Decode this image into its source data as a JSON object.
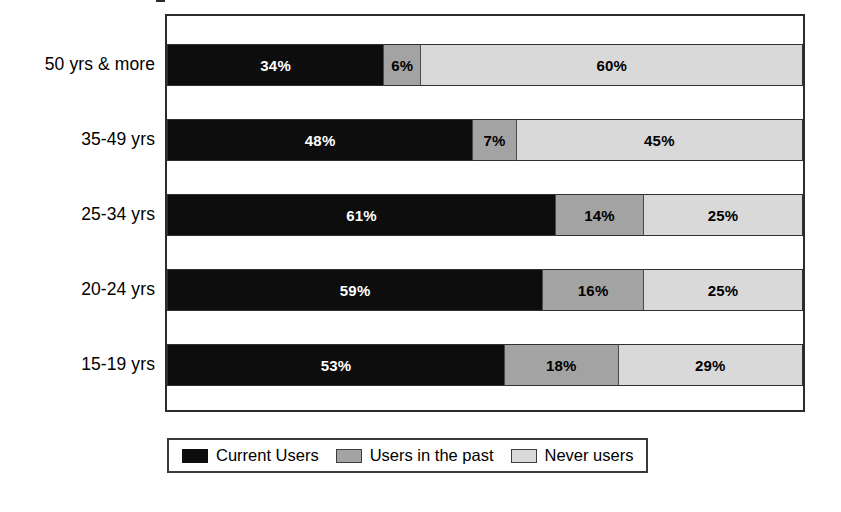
{
  "chart_data": {
    "type": "bar",
    "orientation": "horizontal",
    "stacked": true,
    "normalized_percent": true,
    "title": "",
    "subtitle": "",
    "xlabel": "",
    "ylabel": "",
    "xlim": [
      0,
      100
    ],
    "grid": false,
    "legend_position": "bottom",
    "categories": [
      "50 yrs & more",
      "35-49 yrs",
      "25-34 yrs",
      "20-24 yrs",
      "15-19 yrs"
    ],
    "series": [
      {
        "name": "Current Users",
        "color": "#0d0d0d",
        "values": [
          34,
          48,
          61,
          59,
          53
        ],
        "labels": [
          "34%",
          "48%",
          "61%",
          "59%",
          "53%"
        ]
      },
      {
        "name": "Users in the past",
        "color": "#a3a3a3",
        "values": [
          6,
          7,
          14,
          16,
          18
        ],
        "labels": [
          "6%",
          "7%",
          "14%",
          "16%",
          "18%"
        ]
      },
      {
        "name": "Never users",
        "color": "#d9d9d9",
        "values": [
          60,
          45,
          25,
          25,
          29
        ],
        "labels": [
          "60%",
          "45%",
          "25%",
          "25%",
          "29%"
        ]
      }
    ],
    "rows": [
      {
        "category": "50 yrs & more",
        "segments": [
          {
            "series": "Current Users",
            "value": 34,
            "label": "34%",
            "color": "#0d0d0d",
            "class": "seg-current"
          },
          {
            "series": "Users in the past",
            "value": 6,
            "label": "6%",
            "color": "#a3a3a3",
            "class": "seg-past"
          },
          {
            "series": "Never users",
            "value": 60,
            "label": "60%",
            "color": "#d9d9d9",
            "class": "seg-never"
          }
        ]
      },
      {
        "category": "35-49 yrs",
        "segments": [
          {
            "series": "Current Users",
            "value": 48,
            "label": "48%",
            "color": "#0d0d0d",
            "class": "seg-current"
          },
          {
            "series": "Users in the past",
            "value": 7,
            "label": "7%",
            "color": "#a3a3a3",
            "class": "seg-past"
          },
          {
            "series": "Never users",
            "value": 45,
            "label": "45%",
            "color": "#d9d9d9",
            "class": "seg-never"
          }
        ]
      },
      {
        "category": "25-34 yrs",
        "segments": [
          {
            "series": "Current Users",
            "value": 61,
            "label": "61%",
            "color": "#0d0d0d",
            "class": "seg-current"
          },
          {
            "series": "Users in the past",
            "value": 14,
            "label": "14%",
            "color": "#a3a3a3",
            "class": "seg-past"
          },
          {
            "series": "Never users",
            "value": 25,
            "label": "25%",
            "color": "#d9d9d9",
            "class": "seg-never"
          }
        ]
      },
      {
        "category": "20-24 yrs",
        "segments": [
          {
            "series": "Current Users",
            "value": 59,
            "label": "59%",
            "color": "#0d0d0d",
            "class": "seg-current"
          },
          {
            "series": "Users in the past",
            "value": 16,
            "label": "16%",
            "color": "#a3a3a3",
            "class": "seg-past"
          },
          {
            "series": "Never users",
            "value": 25,
            "label": "25%",
            "color": "#d9d9d9",
            "class": "seg-never"
          }
        ]
      },
      {
        "category": "15-19 yrs",
        "segments": [
          {
            "series": "Current Users",
            "value": 53,
            "label": "53%",
            "color": "#0d0d0d",
            "class": "seg-current"
          },
          {
            "series": "Users in the past",
            "value": 18,
            "label": "18%",
            "color": "#a3a3a3",
            "class": "seg-past"
          },
          {
            "series": "Never users",
            "value": 29,
            "label": "29%",
            "color": "#d9d9d9",
            "class": "seg-never"
          }
        ]
      }
    ],
    "legend": [
      {
        "label": "Current Users",
        "color": "#0d0d0d",
        "swatch_class": "sw-current"
      },
      {
        "label": "Users in the past",
        "color": "#a3a3a3",
        "swatch_class": "sw-past"
      },
      {
        "label": "Never users",
        "color": "#d9d9d9",
        "swatch_class": "sw-never"
      }
    ]
  },
  "layout": {
    "plot": {
      "left": 165,
      "top": 14,
      "width": 640,
      "height": 398
    },
    "bar_height": 42,
    "row_tops": [
      28,
      103,
      178,
      253,
      328
    ],
    "tick_tops": [
      89,
      164,
      239,
      314
    ],
    "label_tops": [
      42,
      117,
      192,
      267,
      342
    ]
  },
  "colors": {
    "current_users": "#0d0d0d",
    "users_in_past": "#a3a3a3",
    "never_users": "#d9d9d9",
    "frame": "#2b2b2b",
    "background": "#ffffff"
  }
}
